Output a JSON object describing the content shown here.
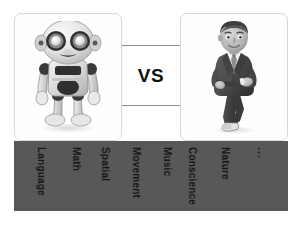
{
  "comparison": {
    "vs_label": "VS",
    "left": {
      "figure_name": "robot-illustration",
      "alt": "Cartoon robot standing, grey and white with large round eyes"
    },
    "right": {
      "figure_name": "businessman-illustration",
      "alt": "Cartoon businessman in dark suit with arms crossed"
    }
  },
  "capabilities": {
    "bar_color": "#585858",
    "text_color": "#171717",
    "items": [
      {
        "label": "Language"
      },
      {
        "label": "Math"
      },
      {
        "label": "Spatial"
      },
      {
        "label": "Movement"
      },
      {
        "label": "Music"
      },
      {
        "label": "Conscience"
      },
      {
        "label": "Nature"
      },
      {
        "label": "..."
      }
    ]
  },
  "colors": {
    "card_border": "#d8d8d8",
    "card_background": "#fefefe",
    "connector_line": "#8d8d8d",
    "page_background": "#ffffff"
  }
}
